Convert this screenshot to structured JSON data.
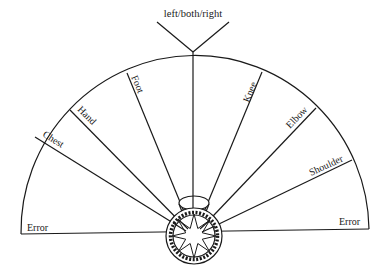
{
  "title_label": "left/both/right",
  "sectors": [
    {
      "label": "Error",
      "side": "left"
    },
    {
      "label": "Chest"
    },
    {
      "label": "Hand"
    },
    {
      "label": "Foot"
    },
    {
      "label": "Knee"
    },
    {
      "label": "Elbow"
    },
    {
      "label": "Shoulder"
    },
    {
      "label": "Error",
      "side": "right"
    }
  ],
  "colors": {
    "ink": "#1a1a1a",
    "background": "#ffffff"
  }
}
